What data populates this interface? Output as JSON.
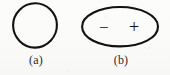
{
  "figure": {
    "background_color": "#fcfcfb",
    "ink_color": "#111111",
    "caption_color": "#2b2b2b",
    "panels": [
      {
        "id": "a",
        "caption": "(a)",
        "shape": "circle",
        "shape_name": "plain-circle",
        "annotations": []
      },
      {
        "id": "b",
        "caption": "(b)",
        "shape": "ellipse",
        "shape_name": "polarized-ellipse",
        "annotations": [
          {
            "symbol": "−",
            "name": "minus-sign",
            "position": "left"
          },
          {
            "symbol": "+",
            "name": "plus-sign",
            "position": "right"
          }
        ]
      }
    ]
  }
}
